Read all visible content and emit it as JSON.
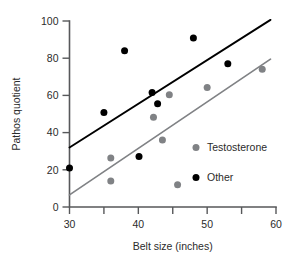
{
  "chart_data": {
    "type": "scatter",
    "title": "",
    "xlabel": "Belt size (inches)",
    "ylabel": "Pathos quotient",
    "xlim": [
      30,
      60
    ],
    "ylim": [
      0,
      100
    ],
    "xticks": [
      30,
      40,
      50,
      60
    ],
    "xtick_labels": [
      "30",
      "40",
      "50",
      "60"
    ],
    "xminorticks": [
      35,
      45,
      55
    ],
    "yticks": [
      0,
      20,
      40,
      60,
      80,
      100
    ],
    "ytick_labels": [
      "0",
      "20",
      "40",
      "60",
      "80",
      "100"
    ],
    "grid": false,
    "legend_position": "right-middle",
    "series": [
      {
        "name": "Testosterone",
        "color": "#808285",
        "marker": "circle",
        "points": [
          {
            "x": 36.0,
            "y": 26.3
          },
          {
            "x": 36.0,
            "y": 14.0
          },
          {
            "x": 42.2,
            "y": 48.3
          },
          {
            "x": 43.5,
            "y": 36.0
          },
          {
            "x": 44.5,
            "y": 60.3
          },
          {
            "x": 45.7,
            "y": 12.0
          },
          {
            "x": 50.0,
            "y": 64.2
          },
          {
            "x": 58.0,
            "y": 74.0
          }
        ],
        "fit_line": {
          "x1": 30,
          "y1": 6.5,
          "x2": 59.2,
          "y2": 79.5
        }
      },
      {
        "name": "Other",
        "color": "#000000",
        "marker": "circle",
        "points": [
          {
            "x": 30.0,
            "y": 21.0
          },
          {
            "x": 35.0,
            "y": 50.8
          },
          {
            "x": 38.0,
            "y": 84.0
          },
          {
            "x": 40.1,
            "y": 27.2
          },
          {
            "x": 42.0,
            "y": 61.5
          },
          {
            "x": 42.8,
            "y": 55.5
          },
          {
            "x": 48.0,
            "y": 90.8
          },
          {
            "x": 53.0,
            "y": 77.0
          }
        ],
        "fit_line": {
          "x1": 30,
          "y1": 32.0,
          "x2": 59.2,
          "y2": 100.6
        }
      }
    ]
  },
  "legend": {
    "items": [
      {
        "label": "Testosterone",
        "color": "#808285"
      },
      {
        "label": "Other",
        "color": "#000000"
      }
    ]
  },
  "colors": {
    "axis": "#57585a",
    "text": "#2b2b2b",
    "series_testosterone": "#808285",
    "series_other": "#000000",
    "background": "#ffffff"
  }
}
